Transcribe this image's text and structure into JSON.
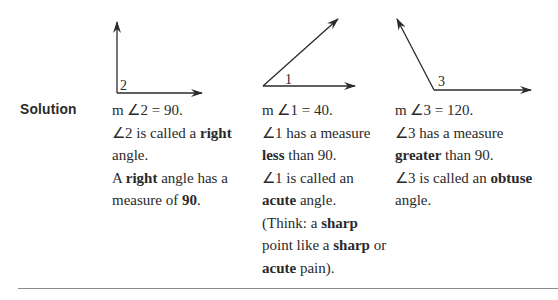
{
  "solution_label": "Solution",
  "diagrams": [
    {
      "label": "2",
      "type": "right"
    },
    {
      "label": "1",
      "type": "acute"
    },
    {
      "label": "3",
      "type": "obtuse"
    }
  ],
  "columns": [
    {
      "lines": [
        [
          {
            "t": "m ∠2 = 90."
          }
        ],
        [
          {
            "t": "∠2 is called a "
          },
          {
            "t": "right",
            "b": true
          }
        ],
        [
          {
            "t": "angle."
          }
        ],
        [
          {
            "t": "A "
          },
          {
            "t": "right",
            "b": true
          },
          {
            "t": " angle has a"
          }
        ],
        [
          {
            "t": "measure of "
          },
          {
            "t": "90",
            "b": true
          },
          {
            "t": "."
          }
        ]
      ]
    },
    {
      "lines": [
        [
          {
            "t": "m ∠1 = 40."
          }
        ],
        [
          {
            "t": "∠1 has a measure"
          }
        ],
        [
          {
            "t": "less",
            "b": true
          },
          {
            "t": " than 90."
          }
        ],
        [
          {
            "t": "∠1 is called an"
          }
        ],
        [
          {
            "t": "acute",
            "b": true
          },
          {
            "t": " angle."
          }
        ],
        [
          {
            "t": "(Think: a "
          },
          {
            "t": "sharp",
            "b": true
          }
        ],
        [
          {
            "t": "point like a "
          },
          {
            "t": "sharp",
            "b": true
          },
          {
            "t": " or"
          }
        ],
        [
          {
            "t": "acute",
            "b": true
          },
          {
            "t": " pain)."
          }
        ]
      ]
    },
    {
      "lines": [
        [
          {
            "t": "m ∠3 = 120."
          }
        ],
        [
          {
            "t": "∠3 has a measure"
          }
        ],
        [
          {
            "t": "greater",
            "b": true
          },
          {
            "t": " than 90."
          }
        ],
        [
          {
            "t": "∠3 is called an "
          },
          {
            "t": "obtuse",
            "b": true
          }
        ],
        [
          {
            "t": "angle."
          }
        ]
      ]
    }
  ]
}
